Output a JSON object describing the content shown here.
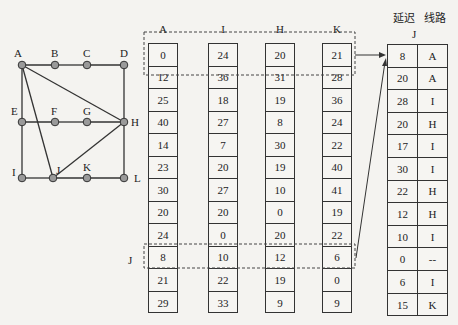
{
  "network": {
    "nodes": [
      {
        "id": "A",
        "x": 22,
        "y": 65,
        "lx": 14,
        "ly": 47
      },
      {
        "id": "B",
        "x": 55,
        "y": 65,
        "lx": 51,
        "ly": 47
      },
      {
        "id": "C",
        "x": 87,
        "y": 65,
        "lx": 83,
        "ly": 47
      },
      {
        "id": "D",
        "x": 124,
        "y": 65,
        "lx": 120,
        "ly": 47
      },
      {
        "id": "E",
        "x": 22,
        "y": 122,
        "lx": 11,
        "ly": 105
      },
      {
        "id": "F",
        "x": 55,
        "y": 122,
        "lx": 51,
        "ly": 105
      },
      {
        "id": "G",
        "x": 87,
        "y": 122,
        "lx": 83,
        "ly": 105
      },
      {
        "id": "H",
        "x": 124,
        "y": 122,
        "lx": 131,
        "ly": 116
      },
      {
        "id": "I",
        "x": 22,
        "y": 178,
        "lx": 12,
        "ly": 166
      },
      {
        "id": "J",
        "x": 53,
        "y": 178,
        "lx": 56,
        "ly": 164
      },
      {
        "id": "K",
        "x": 87,
        "y": 178,
        "lx": 83,
        "ly": 161
      },
      {
        "id": "L",
        "x": 124,
        "y": 178,
        "lx": 134,
        "ly": 172
      }
    ],
    "edges": [
      [
        "A",
        "B"
      ],
      [
        "B",
        "C"
      ],
      [
        "C",
        "D"
      ],
      [
        "A",
        "E"
      ],
      [
        "E",
        "I"
      ],
      [
        "D",
        "H"
      ],
      [
        "H",
        "L"
      ],
      [
        "E",
        "F"
      ],
      [
        "F",
        "G"
      ],
      [
        "G",
        "H"
      ],
      [
        "I",
        "J"
      ],
      [
        "J",
        "K"
      ],
      [
        "K",
        "L"
      ],
      [
        "A",
        "H"
      ],
      [
        "A",
        "J"
      ],
      [
        "J",
        "H"
      ]
    ]
  },
  "vectors": [
    {
      "label": "A",
      "values": [
        "0",
        "12",
        "25",
        "40",
        "14",
        "23",
        "30",
        "20",
        "24",
        "8",
        "21",
        "29"
      ]
    },
    {
      "label": "I",
      "values": [
        "24",
        "36",
        "18",
        "27",
        "7",
        "20",
        "27",
        "20",
        "0",
        "10",
        "22",
        "33"
      ]
    },
    {
      "label": "H",
      "values": [
        "20",
        "31",
        "19",
        "8",
        "30",
        "19",
        "10",
        "0",
        "20",
        "12",
        "19",
        "9"
      ]
    },
    {
      "label": "K",
      "values": [
        "21",
        "28",
        "36",
        "24",
        "22",
        "40",
        "41",
        "19",
        "22",
        "6",
        "0",
        "9"
      ]
    }
  ],
  "row_label_j": "J",
  "new_table": {
    "header_delay": "延迟",
    "header_line": "线路",
    "title": "J",
    "rows": [
      {
        "delay": "8",
        "line": "A"
      },
      {
        "delay": "20",
        "line": "A"
      },
      {
        "delay": "28",
        "line": "I"
      },
      {
        "delay": "20",
        "line": "H"
      },
      {
        "delay": "17",
        "line": "I"
      },
      {
        "delay": "30",
        "line": "I"
      },
      {
        "delay": "22",
        "line": "H"
      },
      {
        "delay": "12",
        "line": "H"
      },
      {
        "delay": "10",
        "line": "I"
      },
      {
        "delay": "0",
        "line": "--"
      },
      {
        "delay": "6",
        "line": "I"
      },
      {
        "delay": "15",
        "line": "K"
      }
    ]
  },
  "colors": {
    "line": "#333333",
    "node_fill": "#9a9a9a",
    "background": "#f4f3f0"
  }
}
